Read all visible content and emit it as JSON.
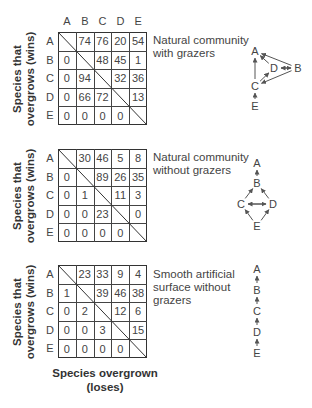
{
  "species": [
    "A",
    "B",
    "C",
    "D",
    "E"
  ],
  "y_axis_label_line1": "Species that",
  "y_axis_label_line2": "overgrows (wins)",
  "x_axis_label_line1": "Species overgrown",
  "x_axis_label_line2": "(loses)",
  "panels": [
    {
      "id": "natural-with-grazers",
      "caption_lines": [
        "Natural community",
        "with grazers"
      ],
      "matrix": [
        [
          null,
          74,
          76,
          20,
          54
        ],
        [
          0,
          null,
          48,
          45,
          1
        ],
        [
          0,
          94,
          null,
          32,
          36
        ],
        [
          0,
          66,
          72,
          null,
          13
        ],
        [
          0,
          0,
          0,
          0,
          null
        ]
      ],
      "network": {
        "nodes": [
          "A",
          "B",
          "C",
          "D",
          "E"
        ],
        "edges": [
          {
            "from": "B",
            "to": "A"
          },
          {
            "from": "D",
            "to": "A"
          },
          {
            "from": "C",
            "to": "A"
          },
          {
            "from": "D",
            "to": "B"
          },
          {
            "from": "B",
            "to": "D"
          },
          {
            "from": "B",
            "to": "C"
          },
          {
            "from": "C",
            "to": "D"
          },
          {
            "from": "E",
            "to": "C"
          }
        ]
      }
    },
    {
      "id": "natural-without-grazers",
      "caption_lines": [
        "Natural community",
        "without grazers"
      ],
      "matrix": [
        [
          null,
          30,
          46,
          5,
          8
        ],
        [
          0,
          null,
          89,
          26,
          35
        ],
        [
          0,
          1,
          null,
          11,
          3
        ],
        [
          0,
          0,
          23,
          null,
          0
        ],
        [
          0,
          0,
          0,
          0,
          null
        ]
      ],
      "network": {
        "nodes": [
          "A",
          "B",
          "C",
          "D",
          "E"
        ],
        "edges": [
          {
            "from": "B",
            "to": "A"
          },
          {
            "from": "C",
            "to": "B"
          },
          {
            "from": "D",
            "to": "B"
          },
          {
            "from": "C",
            "to": "D"
          },
          {
            "from": "D",
            "to": "C"
          },
          {
            "from": "E",
            "to": "C"
          },
          {
            "from": "E",
            "to": "D"
          }
        ]
      }
    },
    {
      "id": "smooth-artificial-without-grazers",
      "caption_lines": [
        "Smooth artificial",
        "surface without",
        "grazers"
      ],
      "matrix": [
        [
          null,
          23,
          33,
          9,
          4
        ],
        [
          1,
          null,
          39,
          46,
          38
        ],
        [
          0,
          2,
          null,
          12,
          6
        ],
        [
          0,
          0,
          3,
          null,
          15
        ],
        [
          0,
          0,
          0,
          0,
          null
        ]
      ],
      "network": {
        "nodes": [
          "A",
          "B",
          "C",
          "D",
          "E"
        ],
        "edges": [
          {
            "from": "B",
            "to": "A"
          },
          {
            "from": "C",
            "to": "B"
          },
          {
            "from": "D",
            "to": "C"
          },
          {
            "from": "E",
            "to": "D"
          }
        ]
      }
    }
  ]
}
